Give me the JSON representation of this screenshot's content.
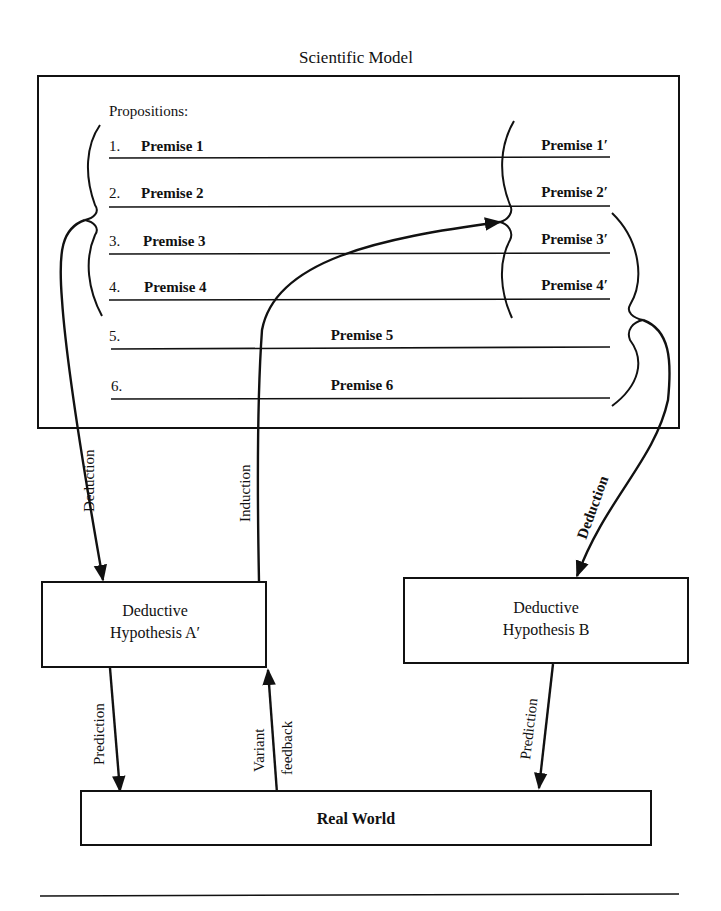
{
  "title": "Scientific Model",
  "model_box": {
    "header": "Propositions:",
    "propositions": [
      {
        "num": "1.",
        "label": "Premise 1",
        "prime": "Premise 1′"
      },
      {
        "num": "2.",
        "label": "Premise 2",
        "prime": "Premise 2′"
      },
      {
        "num": "3.",
        "label": "Premise 3",
        "prime": "Premise 3′"
      },
      {
        "num": "4.",
        "label": "Premise 4",
        "prime": "Premise 4′"
      },
      {
        "num": "5.",
        "label": "Premise 5"
      },
      {
        "num": "6.",
        "label": "Premise 6"
      }
    ]
  },
  "hypotheses": {
    "a": {
      "line1": "Deductive",
      "line2": "Hypothesis A′"
    },
    "b": {
      "line1": "Deductive",
      "line2": "Hypothesis B"
    }
  },
  "real_world": "Real World",
  "arrows": {
    "deduction_a": "Deduction",
    "induction": "Induction",
    "deduction_b": "Deduction",
    "prediction_a": "Prediction",
    "variant": "Variant",
    "feedback": "feedback",
    "prediction_b": "Prediction"
  }
}
